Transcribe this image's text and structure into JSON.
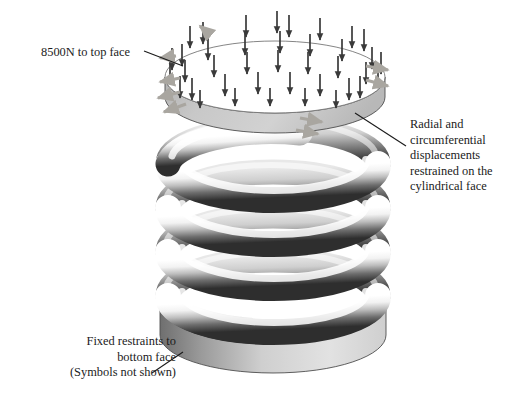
{
  "figure": {
    "background_color": "#ffffff",
    "line_color": "#1b1b1b"
  },
  "annotations": {
    "load": {
      "name": "load-annotation",
      "lines": [
        "8500N to top face"
      ],
      "align": "left",
      "leader": "from text right edge to top disc upper-left rim"
    },
    "radial": {
      "name": "radial-restraint-annotation",
      "lines": [
        "Radial and",
        "circumferential",
        "displacements",
        "restrained on the",
        "cylindrical face"
      ],
      "align": "left",
      "leader": "from text left edge up to top disc right rim"
    },
    "fixed": {
      "name": "fixed-restraint-annotation",
      "lines": [
        "Fixed restraints to",
        "bottom face",
        "(Symbols not shown)"
      ],
      "align": "right",
      "leader": "from text right edge up to bottom disc left rim"
    }
  },
  "model": {
    "component": "helical compression spring",
    "coil_turns_visible": 4,
    "top_plate": {
      "name": "top-face-plate",
      "fill_top": "#ffffff",
      "fill_side": "#c9c9c9",
      "edge_color": "#555555"
    },
    "bottom_plate": {
      "name": "bottom-face-plate",
      "fill_top": "#ffffff",
      "fill_side_dark": "#6e6e6e",
      "fill_side_light": "#d8d8d8",
      "edge_color": "#555555"
    },
    "coil": {
      "name": "spring-coil",
      "highlight_color": "#ffffff",
      "shadow_color": "#2b2b2b",
      "midtone_color": "#9a9a9a"
    }
  },
  "symbols": {
    "load_arrows": {
      "name": "load-arrow",
      "count": 39,
      "direction": "downward",
      "color": "#3a3a3a",
      "meaning": "8500N distributed pressure on top face"
    },
    "restraint_arrows": {
      "name": "restraint-arrow",
      "count": 9,
      "direction": "outward radial",
      "color": "#a9a6a0",
      "meaning": "radial and circumferential restraint on cylindrical face"
    }
  }
}
